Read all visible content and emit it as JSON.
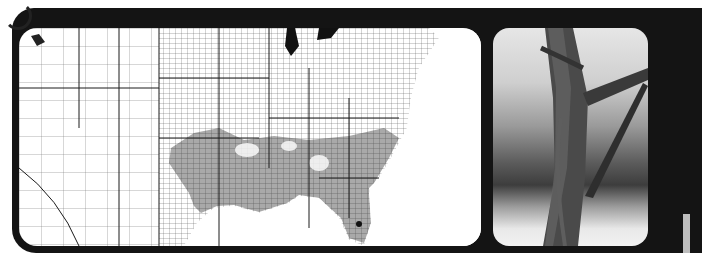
{
  "figure": {
    "map": {
      "kind": "county-level distribution map, eastern/central United States",
      "colors": {
        "background": "#ffffff",
        "county_lines": "#555555",
        "state_lines": "#1a1a1a",
        "range_fill": "#9a9a9a",
        "water": "#1a1a1a"
      }
    },
    "photo": {
      "kind": "black-and-white photograph of a vine twining around a woody stem"
    },
    "frame_color": "#141414"
  }
}
